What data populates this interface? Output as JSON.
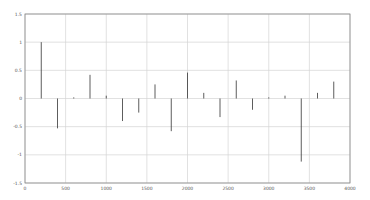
{
  "chart_data": {
    "type": "stem",
    "title": "",
    "xlabel": "",
    "ylabel": "",
    "xlim": [
      0,
      4000
    ],
    "ylim": [
      -1.5,
      1.5
    ],
    "grid": true,
    "legend": null,
    "x_ticks": [
      0,
      500,
      1000,
      1500,
      2000,
      2500,
      3000,
      3500,
      4000
    ],
    "y_ticks": [
      1.5,
      1,
      0.5,
      0,
      -0.5,
      -1,
      -1.5
    ],
    "x_tick_labels": [
      "0",
      "500",
      "1000",
      "1500",
      "2000",
      "2500",
      "3000",
      "3500",
      "4000"
    ],
    "y_tick_labels": [
      "1.5",
      "1",
      "0.5",
      "0",
      "-0.5",
      "-1",
      "-1.5"
    ],
    "series": [
      {
        "name": "signal",
        "color": "#333333",
        "x": [
          200,
          400,
          600,
          800,
          1000,
          1200,
          1400,
          1600,
          1800,
          2000,
          2200,
          2400,
          2600,
          2800,
          3000,
          3200,
          3400,
          3600,
          3800
        ],
        "values": [
          1.0,
          -0.53,
          0.02,
          0.42,
          0.05,
          -0.4,
          -0.25,
          0.25,
          -0.58,
          0.46,
          0.1,
          -0.33,
          0.32,
          -0.2,
          0.02,
          0.05,
          -1.12,
          0.1,
          0.3
        ]
      }
    ]
  },
  "colors": {
    "grid": "#d4d4d4",
    "axis": "#888888",
    "stem": "#333333",
    "background": "#ffffff"
  }
}
